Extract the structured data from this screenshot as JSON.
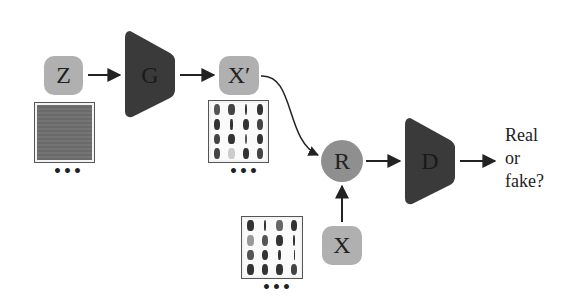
{
  "diagram": {
    "title": "",
    "nodes": {
      "z": {
        "label": "Z",
        "shape": "rounded-box",
        "color": "#b0b0b0"
      },
      "g": {
        "label": "G",
        "shape": "trapezoid",
        "color": "#3a3a3a"
      },
      "x_prime": {
        "label": "X′",
        "shape": "rounded-box",
        "color": "#b0b0b0"
      },
      "r": {
        "label": "R",
        "shape": "circle",
        "color": "#8f8f8f"
      },
      "d": {
        "label": "D",
        "shape": "trapezoid",
        "color": "#3a3a3a"
      },
      "x": {
        "label": "X",
        "shape": "rounded-box",
        "color": "#b0b0b0"
      }
    },
    "images": {
      "noise": {
        "caption": "•••"
      },
      "generated": {
        "caption": "•••"
      },
      "real": {
        "caption": "•••"
      }
    },
    "output": {
      "line1": "Real",
      "line2": "or",
      "line3": "fake?"
    },
    "edges": [
      {
        "from": "Z",
        "to": "G"
      },
      {
        "from": "G",
        "to": "X′"
      },
      {
        "from": "X′",
        "to": "R"
      },
      {
        "from": "X",
        "to": "R"
      },
      {
        "from": "R",
        "to": "D"
      },
      {
        "from": "D",
        "to": "Real or fake?"
      }
    ]
  }
}
